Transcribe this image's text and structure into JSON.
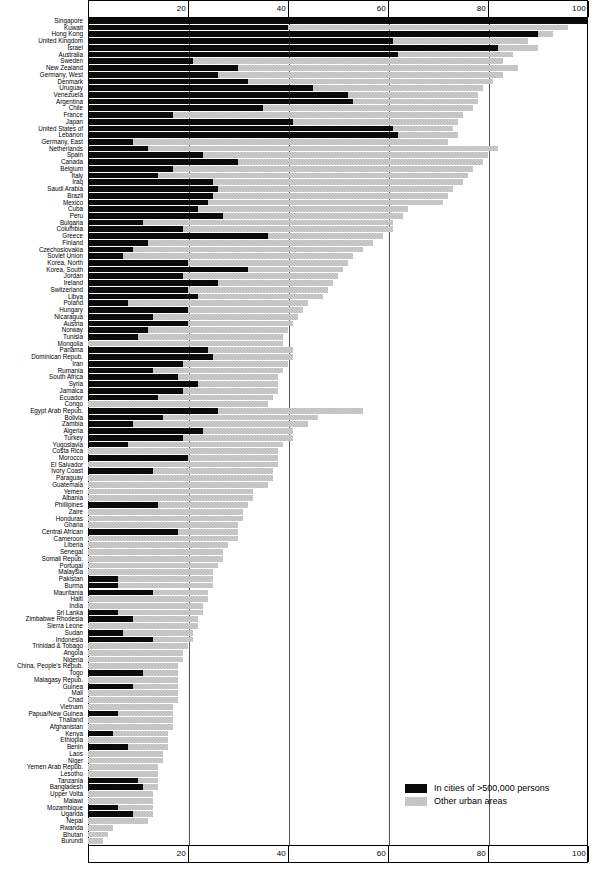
{
  "legend": {
    "big_city_label": "In cities of  >500,000 persons",
    "other_urban_label": "Other urban areas",
    "big_city_color": "#0a0a0a",
    "other_urban_color": "#b9b9b9"
  },
  "axis": {
    "ticks": [
      "20",
      "40",
      "60",
      "80",
      "100"
    ],
    "min": 0,
    "max": 100
  },
  "chart_data": {
    "type": "bar",
    "orientation": "horizontal",
    "stacked": true,
    "title": "",
    "xlabel": "",
    "ylabel": "",
    "xlim": [
      0,
      100
    ],
    "grid": true,
    "gridlines": [
      20,
      40,
      60,
      80
    ],
    "legend_position": "bottom-right",
    "series": [
      {
        "name": "In cities of  >500,000 persons",
        "color": "#0a0a0a"
      },
      {
        "name": "Other urban areas",
        "color": "#b9b9b9"
      }
    ],
    "categories": [
      "Singapore",
      "Kuwait",
      "Hong Kong",
      "United Kingdom",
      "Israel",
      "Australia",
      "Sweden",
      "New Zealand",
      "Germany, West",
      "Denmark",
      "Uruguay",
      "Venezuela",
      "Argentina",
      "Chile",
      "France",
      "Japan",
      "United States of",
      "Lebanon",
      "Germany, East",
      "Netherlands",
      "Spain",
      "Canada",
      "Belgium",
      "Italy",
      "Iraq",
      "Saudi Arabia",
      "Brazil",
      "Mexico",
      "Cuba",
      "Peru",
      "Bulgaria",
      "Columbia",
      "Greece",
      "Finland",
      "Czechoslovakia",
      "Soviet Union",
      "Korea, North",
      "Korea, South",
      "Jordan",
      "Ireland",
      "Switzerland",
      "Libya",
      "Poland",
      "Hungary",
      "Nicaragua",
      "Austria",
      "Norway",
      "Tunisia",
      "Mongolia",
      "Panama",
      "Dominican Repub.",
      "Iran",
      "Rumania",
      "South Africa",
      "Syria",
      "Jamaica",
      "Ecuador",
      "Congo",
      "Egypt Arab Repub.",
      "Bolivia",
      "Zambia",
      "Algeria",
      "Turkey",
      "Yugoslavia",
      "Costa Rica",
      "Morocco",
      "El Salvador",
      "Ivory Coast",
      "Paraguay",
      "Guatemala",
      "Yemen",
      "Albania",
      "Phillipines",
      "Zaire",
      "Honduras",
      "Ghana",
      "Central African",
      "Cameroon",
      "Liberia",
      "Senegal",
      "Somali Repub.",
      "Portugal",
      "Malaysia",
      "Pakistan",
      "Burma",
      "Mauritania",
      "Haiti",
      "India",
      "Sri Lanka",
      "Zimbabwe Rhodesia",
      "Sierra Leone",
      "Sudan",
      "Indonesia",
      "Trinidad & Tobago",
      "Angola",
      "Nigeria",
      "China, People's Repub.",
      "Togo",
      "Malagasy Repub.",
      "Guinea",
      "Mali",
      "Chad",
      "Vietnam",
      "Papua/New Guinea",
      "Thailand",
      "Afghanistan",
      "Kenya",
      "Ethiopia",
      "Benin",
      "Laos",
      "Niger",
      "Yemen Arab Repub.",
      "Lesotho",
      "Tanzania",
      "Bangladesh",
      "Upper Volta",
      "Malawi",
      "Mozambique",
      "Uganda",
      "Nepal",
      "Rwanda",
      "Bhutan",
      "Burundi"
    ],
    "big_city": [
      100,
      40,
      90,
      61,
      82,
      62,
      21,
      30,
      26,
      32,
      45,
      52,
      53,
      35,
      17,
      41,
      61,
      62,
      9,
      12,
      23,
      30,
      17,
      14,
      25,
      26,
      25,
      24,
      22,
      27,
      11,
      19,
      36,
      12,
      9,
      7,
      20,
      32,
      19,
      26,
      20,
      22,
      8,
      20,
      13,
      20,
      12,
      10,
      0,
      24,
      25,
      19,
      13,
      18,
      22,
      19,
      14,
      0,
      26,
      15,
      9,
      23,
      19,
      8,
      0,
      20,
      0,
      13,
      0,
      0,
      0,
      0,
      14,
      0,
      0,
      0,
      18,
      0,
      0,
      0,
      0,
      0,
      0,
      6,
      6,
      13,
      0,
      0,
      6,
      9,
      0,
      7,
      13,
      0,
      0,
      0,
      0,
      11,
      0,
      9,
      0,
      0,
      0,
      6,
      0,
      0,
      5,
      0,
      8,
      0,
      0,
      0,
      0,
      10,
      11,
      0,
      0,
      6,
      9,
      0,
      0,
      0,
      0
    ],
    "other_urban": [
      0,
      56,
      3,
      27,
      8,
      23,
      62,
      56,
      57,
      49,
      34,
      26,
      25,
      42,
      58,
      33,
      12,
      12,
      63,
      70,
      57,
      49,
      60,
      62,
      50,
      47,
      47,
      47,
      42,
      36,
      50,
      42,
      23,
      45,
      46,
      46,
      32,
      19,
      31,
      23,
      28,
      25,
      36,
      23,
      29,
      21,
      28,
      29,
      39,
      17,
      16,
      21,
      26,
      20,
      16,
      19,
      23,
      36,
      29,
      31,
      35,
      18,
      22,
      31,
      38,
      18,
      38,
      24,
      37,
      36,
      33,
      33,
      18,
      31,
      31,
      30,
      12,
      30,
      28,
      27,
      27,
      26,
      25,
      19,
      19,
      11,
      24,
      23,
      17,
      13,
      22,
      14,
      8,
      20,
      19,
      19,
      18,
      7,
      18,
      9,
      18,
      18,
      17,
      11,
      17,
      17,
      11,
      16,
      8,
      15,
      15,
      14,
      14,
      4,
      3,
      13,
      13,
      7,
      4,
      12,
      5,
      4,
      3
    ]
  }
}
